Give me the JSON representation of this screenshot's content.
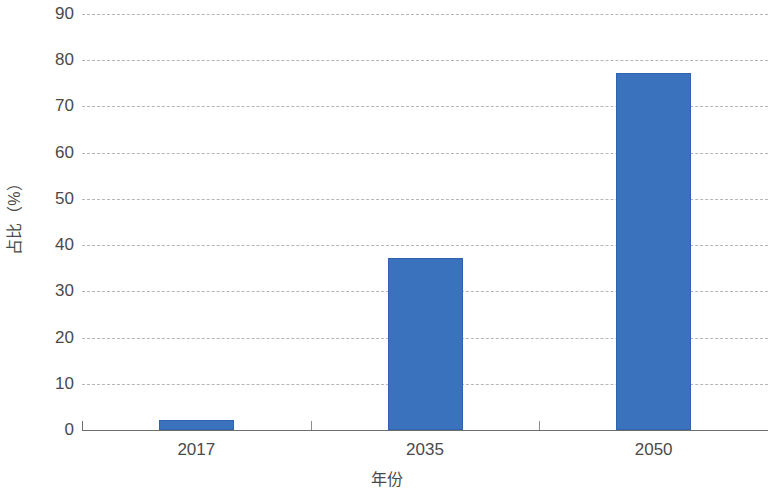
{
  "chart_data": {
    "type": "bar",
    "title": "",
    "subtitle": "",
    "xlabel": "年份",
    "ylabel": "占比（%）",
    "categories": [
      "2017",
      "2035",
      "2050"
    ],
    "values": [
      2.2,
      37.2,
      77.3
    ],
    "series": [
      {
        "name": "占比",
        "values": [
          2.2,
          37.2,
          77.3
        ]
      }
    ],
    "ylim": [
      0,
      90
    ],
    "ytick_labels": [
      "0",
      "10",
      "20",
      "30",
      "40",
      "50",
      "60",
      "70",
      "80",
      "90"
    ],
    "ytick_values": [
      0,
      10,
      20,
      30,
      40,
      50,
      60,
      70,
      80,
      90
    ],
    "grid": "horizontal-dashed",
    "legend": "none",
    "bar_color": "#3a72be",
    "grid_color": "#b6b6b6",
    "axis_color": "#6e6e6e",
    "text_color": "#4a4a4a"
  }
}
